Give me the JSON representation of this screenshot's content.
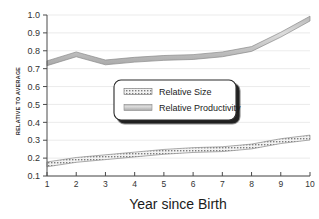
{
  "chart_data": {
    "type": "line",
    "title": "",
    "xlabel": "Year since Birth",
    "ylabel": "RELATIVE TO AVERAGE",
    "x": [
      1,
      2,
      3,
      4,
      5,
      6,
      7,
      8,
      9,
      10
    ],
    "xtick_labels": [
      "1",
      "2",
      "3",
      "4",
      "5",
      "6",
      "7",
      "8",
      "9",
      "10"
    ],
    "ytick_labels": [
      "1.0",
      "0.9",
      "0.8",
      "0.7",
      "0.6",
      "0.5",
      "0.4",
      "0.3",
      "0.2",
      "0.1"
    ],
    "xlim": [
      1,
      10
    ],
    "ylim": [
      0.1,
      1.0
    ],
    "grid": "horizontal",
    "legend_position": "center",
    "series": [
      {
        "name": "Relative Size",
        "style": "hatched-band",
        "values": [
          0.165,
          0.19,
          0.205,
          0.22,
          0.235,
          0.245,
          0.25,
          0.265,
          0.295,
          0.315
        ]
      },
      {
        "name": "Relative Productivity",
        "style": "solid-band",
        "values": [
          0.73,
          0.78,
          0.735,
          0.75,
          0.76,
          0.765,
          0.78,
          0.81,
          0.89,
          0.98
        ]
      }
    ]
  },
  "legend": {
    "entries": [
      {
        "label": "Relative Size",
        "swatch": "hatched-swatch"
      },
      {
        "label": "Relative Productivity",
        "swatch": "solid-swatch"
      }
    ]
  },
  "colors": {
    "band_fill": "#c9c9c9",
    "band_edge": "#8a8a8a",
    "grid": "#e2e2e2",
    "axis": "#4a4a4a",
    "text": "#1b1b1b",
    "legend_shadow": "#101010",
    "background": "#ffffff"
  }
}
